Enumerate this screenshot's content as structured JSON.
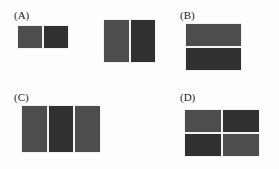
{
  "page": {
    "width": 279,
    "height": 169,
    "background": "#fdfdfd"
  },
  "palette": {
    "light_gray_fill": "#4d4d4d",
    "dark_gray_fill": "#303030",
    "frame": "#f2f2f2",
    "label_text": "#1a1a1a"
  },
  "options": [
    {
      "id": "A",
      "label": "(A)",
      "figures": [
        {
          "name": "small-two-part-rectangle",
          "split": "vertical",
          "parts": 2,
          "cells": [
            {
              "shade": "light"
            },
            {
              "shade": "dark"
            }
          ]
        },
        {
          "name": "large-two-part-rectangle",
          "split": "vertical",
          "parts": 2,
          "cells": [
            {
              "shade": "light"
            },
            {
              "shade": "dark"
            }
          ]
        }
      ]
    },
    {
      "id": "B",
      "label": "(B)",
      "figures": [
        {
          "name": "square-two-part",
          "split": "horizontal",
          "parts": 2,
          "cells": [
            {
              "shade": "light"
            },
            {
              "shade": "dark"
            }
          ]
        }
      ]
    },
    {
      "id": "C",
      "label": "(C)",
      "figures": [
        {
          "name": "rectangle-three-part",
          "split": "vertical",
          "parts": 3,
          "cells": [
            {
              "shade": "light"
            },
            {
              "shade": "dark"
            },
            {
              "shade": "light"
            }
          ]
        }
      ]
    },
    {
      "id": "D",
      "label": "(D)",
      "figures": [
        {
          "name": "rectangle-four-part-grid",
          "split": "grid-2x2",
          "parts": 4,
          "cells": [
            {
              "shade": "light"
            },
            {
              "shade": "dark"
            },
            {
              "shade": "dark"
            },
            {
              "shade": "light"
            }
          ]
        }
      ]
    }
  ]
}
